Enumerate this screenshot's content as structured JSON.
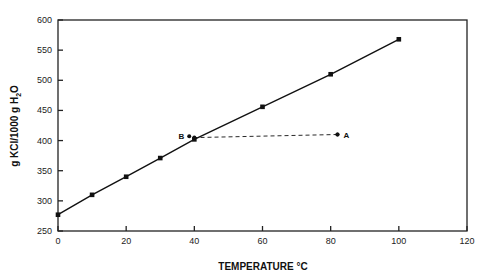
{
  "chart_data": {
    "type": "line",
    "title": "",
    "xlabel": "TEMPERATURE °C",
    "ylabel": "g KCl/1000 g H2O",
    "ylabel_parts": {
      "main": "g KCl/1000 g H",
      "sub": "2",
      "tail": "O"
    },
    "xlim": [
      0,
      120
    ],
    "ylim": [
      250,
      600
    ],
    "xticks": [
      0,
      20,
      40,
      60,
      80,
      100,
      120
    ],
    "yticks": [
      250,
      300,
      350,
      400,
      450,
      500,
      550,
      600
    ],
    "grid": false,
    "legend": null,
    "series": [
      {
        "name": "KCl solubility curve",
        "style": "solid",
        "marker": "square",
        "x": [
          0,
          10,
          20,
          30,
          40,
          60,
          80,
          100
        ],
        "y": [
          277,
          310,
          340,
          371,
          402,
          456,
          510,
          568
        ]
      },
      {
        "name": "cooling path A to B",
        "style": "dashed",
        "marker": "dot",
        "x": [
          82,
          40
        ],
        "y": [
          410,
          405
        ]
      }
    ],
    "annotations": [
      {
        "label": "A",
        "x": 82,
        "y": 410
      },
      {
        "label": "B",
        "x": 38.5,
        "y": 407
      }
    ]
  }
}
